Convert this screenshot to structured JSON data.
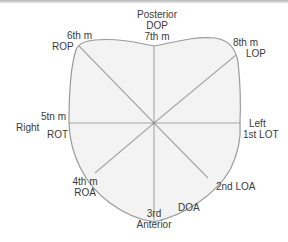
{
  "diagram": {
    "colors": {
      "fill": "#f3f3f3",
      "stroke": "#9a9a9a",
      "text": "#3a3a3a"
    },
    "labels": {
      "top": {
        "line1": "Posterior",
        "line2": "DOP",
        "line3": "7th m"
      },
      "top_right": {
        "line1": "8th m",
        "line2": "LOP"
      },
      "right": {
        "line1": "Left",
        "line2": "1st LOT"
      },
      "bottom_right": {
        "line1": "2nd LOA"
      },
      "bottom_right_inner": {
        "line1": "DOA"
      },
      "bottom": {
        "line1": "3rd",
        "line2": "Anterior"
      },
      "bottom_left": {
        "line1": "4th m",
        "line2": "ROA"
      },
      "left": {
        "line1": "5tn m",
        "line2": "ROT",
        "side": "Right"
      },
      "top_left": {
        "line1": "6th m",
        "line2": "ROP"
      }
    },
    "positions": [
      {
        "code": "DOP",
        "name": "Direct Occiput Posterior",
        "month": "7th m"
      },
      {
        "code": "LOP",
        "name": "Left Occiput Posterior",
        "month": "8th m"
      },
      {
        "code": "LOT",
        "name": "Left Occiput Transverse",
        "month": "1st"
      },
      {
        "code": "LOA",
        "name": "Left Occiput Anterior",
        "month": "2nd"
      },
      {
        "code": "DOA",
        "name": "Direct Occiput Anterior",
        "month": ""
      },
      {
        "code": "ROA",
        "name": "Right Occiput Anterior",
        "month": "4th m"
      },
      {
        "code": "ROT",
        "name": "Right Occiput Transverse",
        "month": "5tn m"
      },
      {
        "code": "ROP",
        "name": "Right Occiput Posterior",
        "month": "6th m"
      }
    ]
  }
}
